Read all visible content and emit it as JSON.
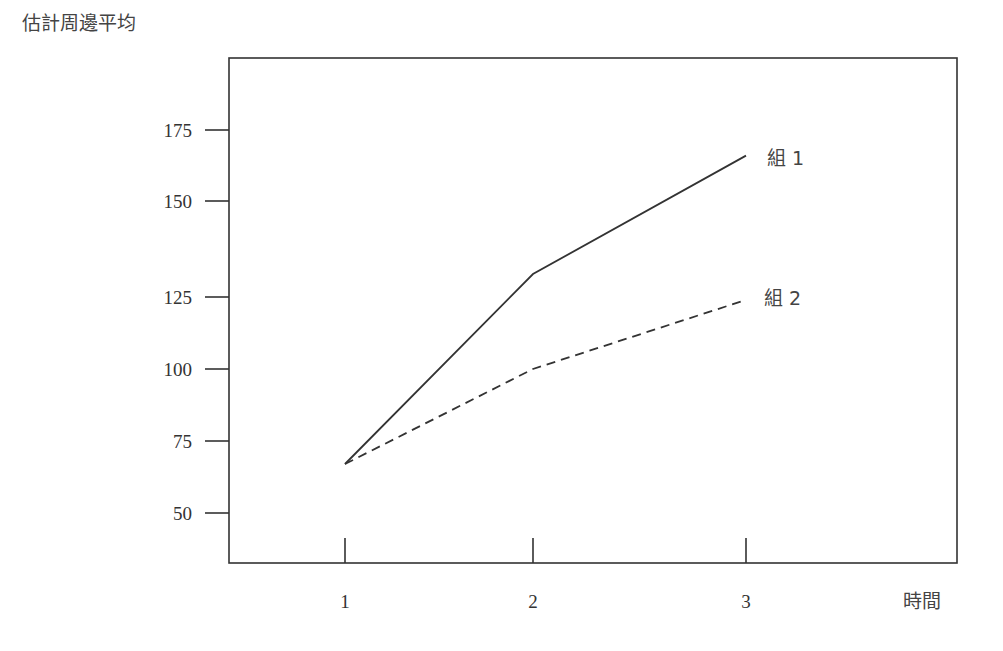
{
  "chart_data": {
    "type": "line",
    "title": "",
    "ylabel": "估計周邊平均",
    "xlabel": "時間",
    "categories": [
      "1",
      "2",
      "3"
    ],
    "x": [
      1,
      2,
      3
    ],
    "series": [
      {
        "name": "組 1",
        "label": "組 1",
        "style": "solid",
        "values": [
          67,
          131,
          166
        ]
      },
      {
        "name": "組 2",
        "label": "組 2",
        "style": "dashed",
        "values": [
          67,
          100,
          124
        ]
      }
    ],
    "y_ticks": [
      50,
      75,
      100,
      125,
      150,
      175
    ],
    "x_ticks": [
      1,
      2,
      3
    ],
    "ylim": [
      40,
      195
    ],
    "grid": false,
    "legend": "inline labels at line ends",
    "colors": {
      "line": "#333333",
      "frame": "#333333",
      "text": "#333333"
    }
  }
}
